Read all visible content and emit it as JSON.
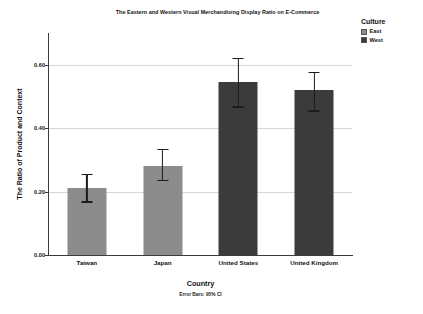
{
  "chart_data": {
    "type": "bar",
    "title": "The Eastern and Western Visual Merchandising Display Ratio on E-Commerce",
    "xlabel": "Country",
    "ylabel": "The Ratio of Product and Context",
    "footnote": "Error Bars: 95% CI",
    "categories": [
      "Taiwan",
      "Japan",
      "United States",
      "United Kingdom"
    ],
    "values": [
      0.21,
      0.28,
      0.545,
      0.52
    ],
    "error_low": [
      0.165,
      0.232,
      0.465,
      0.452
    ],
    "error_high": [
      0.256,
      0.335,
      0.622,
      0.578
    ],
    "groups": [
      "East",
      "East",
      "West",
      "West"
    ],
    "ylim": [
      0.0,
      0.7
    ],
    "yticks": [
      0.0,
      0.2,
      0.4,
      0.6
    ],
    "ytick_labels": [
      "0.00",
      "0.20",
      "0.40",
      "0.60"
    ],
    "grid": true,
    "legend_position": "right",
    "colors": {
      "east": "#8c8c8c",
      "west": "#3b3b3b",
      "grid": "#d6d6d6",
      "axis": "#3b3b3b",
      "error": "#1c1c1c",
      "background": "#ffffff",
      "text": "#111111"
    }
  },
  "legend": {
    "title": "Culture",
    "items": [
      {
        "label": "East",
        "color": "#8c8c8c"
      },
      {
        "label": "West",
        "color": "#3b3b3b"
      }
    ]
  }
}
